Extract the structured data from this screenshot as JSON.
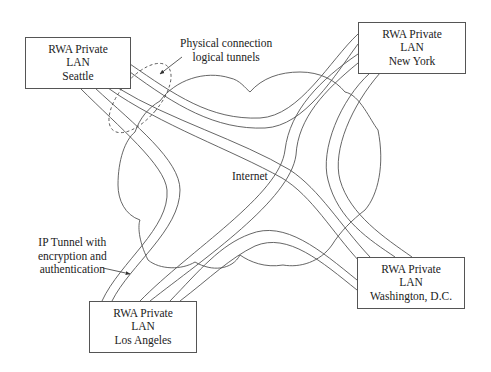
{
  "colors": {
    "line": "#555555",
    "background": "#ffffff",
    "text": "#222222"
  },
  "network": {
    "label": "Internet",
    "shape": "cloud"
  },
  "sites": [
    {
      "id": "seattle",
      "line1": "RWA Private",
      "line2": "LAN",
      "line3": "Seattle"
    },
    {
      "id": "new-york",
      "line1": "RWA Private",
      "line2": "LAN",
      "line3": "New York"
    },
    {
      "id": "washington",
      "line1": "RWA Private",
      "line2": "LAN",
      "line3": "Washington, D.C."
    },
    {
      "id": "los-angeles",
      "line1": "RWA Private",
      "line2": "LAN",
      "line3": "Los Angeles"
    }
  ],
  "annotations": {
    "physical": {
      "line1": "Physical connection",
      "line2": "logical tunnels"
    },
    "tunnel": {
      "line1": "IP Tunnel with",
      "line2": "encryption and",
      "line3": "authentication"
    }
  },
  "tunnels": [
    {
      "from": "Seattle",
      "to": "New York"
    },
    {
      "from": "Seattle",
      "to": "Washington, D.C."
    },
    {
      "from": "Seattle",
      "to": "Los Angeles"
    },
    {
      "from": "New York",
      "to": "Los Angeles"
    },
    {
      "from": "New York",
      "to": "Washington, D.C."
    },
    {
      "from": "Los Angeles",
      "to": "Washington, D.C."
    }
  ]
}
